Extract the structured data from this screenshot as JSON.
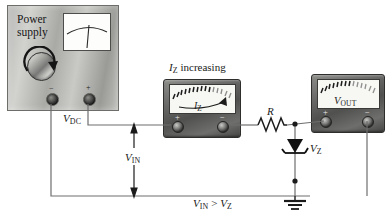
{
  "figure": {
    "background_color": "#ffffff",
    "wire_color": "#6e6e6e"
  },
  "power_supply": {
    "name": "power-supply",
    "label_line1": "Power",
    "label_line2": "supply",
    "terminal_negative": "−",
    "terminal_positive": "+",
    "knob_rotation_hint": "clockwise"
  },
  "ammeter": {
    "name": "zener-current-meter",
    "caption": "increasing",
    "caption_symbol": "I",
    "caption_subscript": "Z",
    "face_symbol": "I",
    "face_subscript": "Z",
    "terminal_positive": "+",
    "terminal_negative": "−",
    "needle_direction": "right"
  },
  "voltmeter": {
    "name": "output-voltage-meter",
    "face_symbol": "V",
    "face_subscript": "OUT",
    "terminal_positive": "+",
    "terminal_negative": "−"
  },
  "components": {
    "resistor_label": "R",
    "zener_label_symbol": "V",
    "zener_label_subscript": "Z",
    "ground_label": ""
  },
  "annotations": {
    "vdc_symbol": "V",
    "vdc_subscript": "DC",
    "vin_symbol": "V",
    "vin_subscript": "IN",
    "condition_left_symbol": "V",
    "condition_left_subscript": "IN",
    "condition_operator": " > ",
    "condition_right_symbol": "V",
    "condition_right_subscript": "Z"
  }
}
